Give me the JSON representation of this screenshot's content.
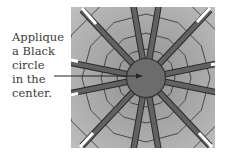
{
  "annotation": {
    "lines": [
      "Applique",
      "a Black",
      "circle",
      "in the",
      "center."
    ]
  },
  "diagram": {
    "type": "quilt-block",
    "spoke_count": 12,
    "colors": {
      "background_light": "#b7b7b7",
      "background_mid": "#9c9c9c",
      "spoke": "#5c5c5c",
      "center_circle": "#6e6e6e",
      "seam": "#2a2a2a",
      "spoke_tip": "#ffffff"
    }
  }
}
